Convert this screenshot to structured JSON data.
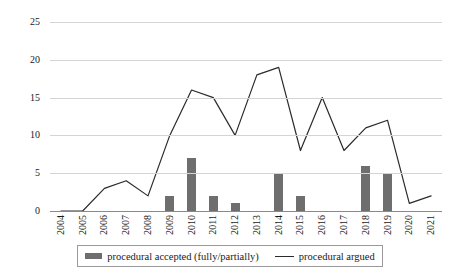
{
  "chart_data": {
    "type": "bar",
    "title": "",
    "xlabel": "",
    "ylabel": "",
    "ylim": [
      0,
      25
    ],
    "yticks": [
      0,
      5,
      10,
      15,
      20,
      25
    ],
    "grid": true,
    "legend_position": "bottom",
    "categories": [
      "2004",
      "2005",
      "2006",
      "2007",
      "2008",
      "2009",
      "2010",
      "2011",
      "2012",
      "2013",
      "2014",
      "2015",
      "2016",
      "2017",
      "2018",
      "2019",
      "2020",
      "2021"
    ],
    "series": [
      {
        "name": "procedural accepted (fully/partially)",
        "type": "bar",
        "color": "#6e6e6e",
        "values": [
          0,
          0,
          0,
          0,
          0,
          2,
          7,
          2,
          1,
          0,
          5,
          2,
          0,
          0,
          6,
          5,
          0,
          0
        ]
      },
      {
        "name": "procedural argued",
        "type": "line",
        "color": "#2b2b2b",
        "values": [
          0,
          0,
          3,
          4,
          2,
          10,
          16,
          15,
          10,
          18,
          19,
          8,
          15,
          8,
          11,
          12,
          1,
          2
        ]
      }
    ]
  },
  "legend": {
    "items": [
      {
        "label": "procedural accepted (fully/partially)",
        "marker": "bar-swatch"
      },
      {
        "label": "procedural argued",
        "marker": "line-swatch"
      }
    ]
  },
  "colors": {
    "bar": "#6e6e6e",
    "line": "#2b2b2b",
    "grid": "#d4d4d4",
    "axis": "#8a8a8a",
    "text": "#1a1a1a",
    "background": "#ffffff"
  }
}
